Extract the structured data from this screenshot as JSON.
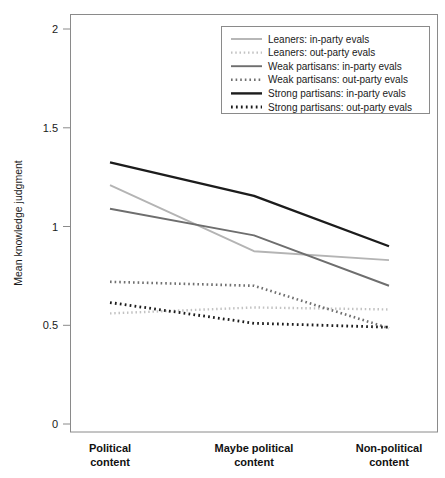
{
  "chart_data": {
    "type": "line",
    "title": "",
    "xlabel": "",
    "ylabel": "Mean knowledge judgment",
    "categories": [
      "Political content",
      "Maybe political content",
      "Non-political content"
    ],
    "category_lines": [
      [
        "Political",
        "content"
      ],
      [
        "Maybe political",
        "content"
      ],
      [
        "Non-political",
        "content"
      ]
    ],
    "ylim": [
      0,
      2
    ],
    "yticks": [
      0,
      0.5,
      1,
      1.5,
      2
    ],
    "ytick_labels": [
      "0",
      "0.5",
      "1",
      "1.5",
      "2"
    ],
    "grid": false,
    "legend_position": "top-right",
    "series": [
      {
        "name": "Leaners: in-party evals",
        "values": [
          1.21,
          0.875,
          0.83
        ],
        "color": "#b4b4b4",
        "style": "solid",
        "width": 1.9
      },
      {
        "name": "Leaners: out-party evals",
        "values": [
          0.56,
          0.59,
          0.58
        ],
        "color": "#c2c2c2",
        "style": "dotted",
        "width": 2.4
      },
      {
        "name": "Weak partisans: in-party evals",
        "values": [
          1.09,
          0.955,
          0.7
        ],
        "color": "#6e6e6e",
        "style": "solid",
        "width": 1.9
      },
      {
        "name": "Weak partisans: out-party evals",
        "values": [
          0.72,
          0.7,
          0.485
        ],
        "color": "#707070",
        "style": "dotted",
        "width": 2.6
      },
      {
        "name": "Strong partisans: in-party evals",
        "values": [
          1.325,
          1.155,
          0.9
        ],
        "color": "#1c1c1c",
        "style": "solid",
        "width": 2.4
      },
      {
        "name": "Strong partisans: out-party evals",
        "values": [
          0.615,
          0.51,
          0.49
        ],
        "color": "#1c1c1c",
        "style": "dotted",
        "width": 2.8
      }
    ]
  },
  "legend": {
    "items": [
      "Leaners: in-party evals",
      "Leaners: out-party evals",
      "Weak partisans: in-party evals",
      "Weak partisans: out-party evals",
      "Strong partisans: in-party evals",
      "Strong partisans: out-party evals"
    ]
  },
  "colors": {
    "frame": "#8a8a8a",
    "text": "#1a1a1a",
    "background": "#ffffff",
    "light_gray": "#b4b4b4",
    "mid_gray": "#6e6e6e",
    "dark": "#1c1c1c"
  }
}
